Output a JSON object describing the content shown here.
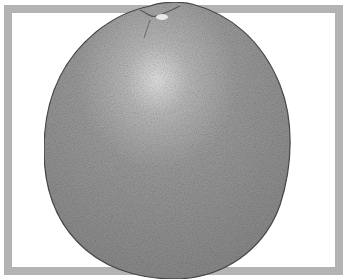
{
  "image": {
    "subject": "grapefruit",
    "style": "grayscale illustration with stippled texture",
    "colors": {
      "background": "#ffffff",
      "frame": "#b3b3b3",
      "fruit_base": "#8c8c8c",
      "fruit_highlight": "#d8d8d8",
      "fruit_outline": "#4a4a4a"
    }
  }
}
